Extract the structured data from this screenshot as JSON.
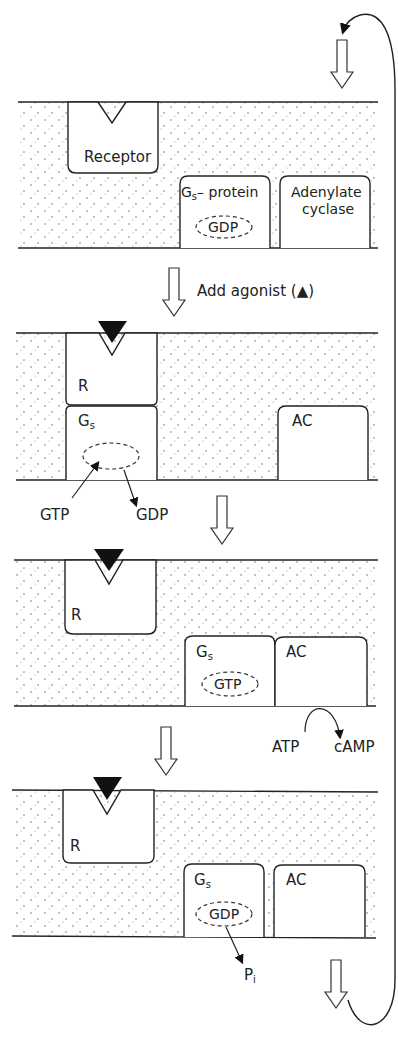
{
  "diagram": {
    "panels": [
      {
        "step": 1,
        "receptor_label": "Receptor",
        "gprotein_label": "G",
        "gprotein_sub": "s",
        "gprotein_suffix": "– protein",
        "nucleotide": "GDP",
        "ac_label_line1": "Adenylate",
        "ac_label_line2": "cyclase"
      },
      {
        "step": 2,
        "receptor_label": "R",
        "gprotein_label": "G",
        "gprotein_sub": "s",
        "ac_label": "AC",
        "in_label": "GTP",
        "out_label": "GDP"
      },
      {
        "step": 3,
        "receptor_label": "R",
        "gprotein_label": "G",
        "gprotein_sub": "s",
        "nucleotide": "GTP",
        "ac_label": "AC",
        "substrate": "ATP",
        "product": "cAMP"
      },
      {
        "step": 4,
        "receptor_label": "R",
        "gprotein_label": "G",
        "gprotein_sub": "s",
        "nucleotide": "GDP",
        "ac_label": "AC",
        "released": "P",
        "released_sub": "i"
      }
    ],
    "transitions": {
      "add_agonist_label": "Add agonist (",
      "agonist_symbol": "▲",
      "add_agonist_close": ")"
    }
  }
}
